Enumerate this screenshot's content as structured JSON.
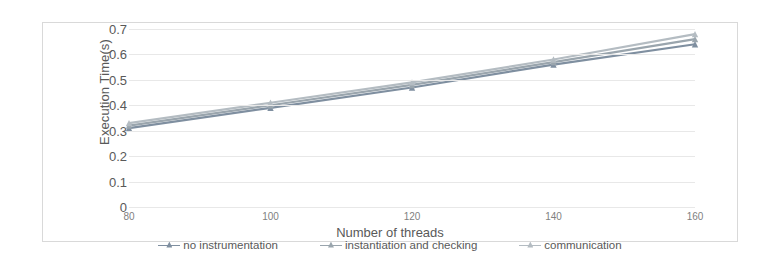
{
  "chart_data": {
    "type": "line",
    "title": "",
    "xlabel": "Number of threads",
    "ylabel": "Execution Time(s)",
    "x": [
      80,
      100,
      120,
      140,
      160
    ],
    "xticklabels": [
      "80",
      "100",
      "120",
      "140",
      "160"
    ],
    "yticklabels": [
      "0.7",
      "0.6",
      "0.5",
      "0.4",
      "0.3",
      "0.2",
      "0.1",
      "0"
    ],
    "yticks": [
      0.7,
      0.6,
      0.5,
      0.4,
      0.3,
      0.2,
      0.1,
      0
    ],
    "ylim": [
      0,
      0.7
    ],
    "xlim": [
      80,
      160
    ],
    "grid": "horizontal",
    "legend_position": "bottom",
    "series": [
      {
        "name": "no instrumentation",
        "values": [
          0.31,
          0.39,
          0.47,
          0.56,
          0.64
        ],
        "color": "#7f8fa0"
      },
      {
        "name": "instantiation and checking",
        "values": [
          0.32,
          0.4,
          0.48,
          0.57,
          0.66
        ],
        "color": "#9aa5ad"
      },
      {
        "name": "communication",
        "values": [
          0.33,
          0.41,
          0.49,
          0.58,
          0.68
        ],
        "color": "#b4bcc2"
      }
    ]
  },
  "colors": {
    "frame_border": "#d9d9d9",
    "gridline": "#e8e8e8",
    "axis_text": "#595959",
    "tick_text": "#7f7f7f",
    "background": "#ffffff"
  }
}
